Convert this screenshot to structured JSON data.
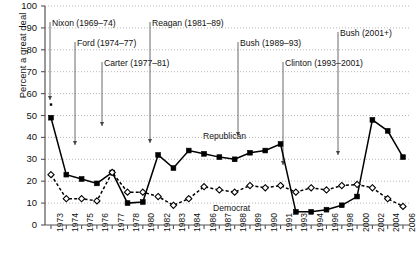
{
  "chart_data": {
    "type": "line",
    "title": "",
    "xlabel": "",
    "ylabel": "Percent a great deal",
    "ylim": [
      0,
      100
    ],
    "ytick_labels": [
      "0",
      "10",
      "20",
      "30",
      "40",
      "50",
      "60",
      "70",
      "80",
      "90",
      "100"
    ],
    "ytick_values": [
      0,
      10,
      20,
      30,
      40,
      50,
      60,
      70,
      80,
      90,
      100
    ],
    "grid": true,
    "grid_orientation": "horizontal",
    "legend_position": "inline-labels",
    "categories": [
      "1973",
      "1974",
      "1975",
      "1976",
      "1977",
      "1978",
      "1980",
      "1982",
      "1983",
      "1984",
      "1986",
      "1987",
      "1988",
      "1989",
      "1990",
      "1991",
      "1993",
      "1994",
      "1996",
      "1998",
      "2000",
      "2002",
      "2004",
      "2006"
    ],
    "series": [
      {
        "name": "Republican",
        "marker": "filled-square",
        "line_style": "solid",
        "color": "#000000",
        "values": [
          49,
          23,
          21,
          19,
          24,
          10,
          10.5,
          32,
          26,
          34,
          32.5,
          31,
          30,
          33,
          34,
          37,
          6,
          6,
          7,
          9,
          13,
          48,
          43,
          31
        ]
      },
      {
        "name": "Democrat",
        "marker": "open-diamond",
        "line_style": "dashed",
        "color": "#000000",
        "values": [
          23,
          12,
          12,
          11,
          24,
          15,
          15,
          13,
          9,
          12,
          17.5,
          16,
          15,
          18,
          17,
          18,
          15,
          17,
          16,
          18,
          18.5,
          17,
          12,
          8.5
        ]
      }
    ],
    "annotations": [
      {
        "label": "Nixon (1969–74)",
        "target_year": "1973",
        "text_x": 52,
        "text_y": 18,
        "line_x": 50,
        "line_top": 22,
        "line_bottom": 100
      },
      {
        "label": "Ford (1974–77)",
        "target_year": "1974",
        "text_x": 77,
        "text_y": 38,
        "line_x": 75,
        "line_top": 42,
        "line_bottom": 145
      },
      {
        "label": "Carter (1977–81)",
        "target_year": "1977",
        "text_x": 104,
        "text_y": 58,
        "line_x": 102,
        "line_top": 62,
        "line_bottom": 126
      },
      {
        "label": "Reagan (1981–89)",
        "target_year": "1982",
        "text_x": 152,
        "text_y": 18,
        "line_x": 150,
        "line_top": 22,
        "line_bottom": 143
      },
      {
        "label": "Bush (1989–93)",
        "target_year": "1989",
        "text_x": 240,
        "text_y": 38,
        "line_x": 238,
        "line_top": 42,
        "line_bottom": 136
      },
      {
        "label": "Clinton (1993–2001)",
        "target_year": "1993",
        "text_x": 285,
        "text_y": 58,
        "line_x": 283,
        "line_top": 62,
        "line_bottom": 165
      },
      {
        "label": "Bush (2001+)",
        "target_year": "2002",
        "text_x": 340,
        "text_y": 28,
        "line_x": 338,
        "line_top": 32,
        "line_bottom": 155
      }
    ],
    "series_labels": [
      {
        "name": "Republican",
        "x": 203,
        "y": 131
      },
      {
        "name": "Democrat",
        "x": 213,
        "y": 203
      }
    ],
    "extra_marks": [
      {
        "name": "partial-marker-1973-top",
        "year": "1973",
        "value": 55
      }
    ]
  }
}
